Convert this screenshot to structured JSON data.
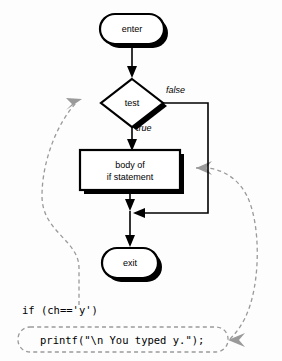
{
  "diagram": {
    "nodes": {
      "enter": "enter",
      "test": "test",
      "body_line1": "body of",
      "body_line2": "if statement",
      "exit": "exit"
    },
    "edge_labels": {
      "false": "false",
      "true": "true"
    },
    "code": {
      "line1": "if (ch=='y')",
      "line2": "printf(\"\\n You typed y.\");"
    },
    "colors": {
      "stroke": "#000000",
      "annotation": "#9a9a9a",
      "fill": "#ffffff",
      "background": "#fdfdfd"
    }
  }
}
